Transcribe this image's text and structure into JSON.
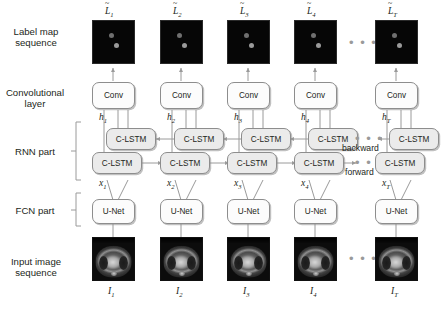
{
  "figure": {
    "row_labels": [
      {
        "id": "label-map-sequence",
        "text": "Label map\nsequence"
      },
      {
        "id": "convolutional-layer",
        "text": "Convolutional\nlayer"
      },
      {
        "id": "rnn-part",
        "text": "RNN part"
      },
      {
        "id": "fcn-part",
        "text": "FCN part"
      },
      {
        "id": "input-image-sequence",
        "text": "Input image\nsequence"
      }
    ],
    "direction_labels": {
      "backward": "backward",
      "forward": "forward"
    },
    "ellipsis": "• • •",
    "node_labels": {
      "conv": "Conv",
      "lstm": "C-LSTM",
      "unet": "U-Net"
    },
    "columns": [
      {
        "index": 1,
        "output_label": {
          "base": "L",
          "accent": "~",
          "sub": "1"
        },
        "hidden_label": {
          "base": "h",
          "sub": "1"
        },
        "feature_label": {
          "base": "x",
          "sub": "1"
        },
        "input_label": {
          "base": "I",
          "sub": "1"
        },
        "conv": "Conv",
        "lstm_backward": "C-LSTM",
        "lstm_forward": "C-LSTM",
        "unet": "U-Net"
      },
      {
        "index": 2,
        "output_label": {
          "base": "L",
          "accent": "~",
          "sub": "2"
        },
        "hidden_label": {
          "base": "h",
          "sub": "2"
        },
        "feature_label": {
          "base": "x",
          "sub": "2"
        },
        "input_label": {
          "base": "I",
          "sub": "2"
        },
        "conv": "Conv",
        "lstm_backward": "C-LSTM",
        "lstm_forward": "C-LSTM",
        "unet": "U-Net"
      },
      {
        "index": 3,
        "output_label": {
          "base": "L",
          "accent": "~",
          "sub": "3"
        },
        "hidden_label": {
          "base": "h",
          "sub": "3"
        },
        "feature_label": {
          "base": "x",
          "sub": "3"
        },
        "input_label": {
          "base": "I",
          "sub": "3"
        },
        "conv": "Conv",
        "lstm_backward": "C-LSTM",
        "lstm_forward": "C-LSTM",
        "unet": "U-Net"
      },
      {
        "index": 4,
        "output_label": {
          "base": "L",
          "accent": "~",
          "sub": "4"
        },
        "hidden_label": {
          "base": "h",
          "sub": "4"
        },
        "feature_label": {
          "base": "x",
          "sub": "4"
        },
        "input_label": {
          "base": "I",
          "sub": "4"
        },
        "conv": "Conv",
        "lstm_backward": "C-LSTM",
        "lstm_forward": "C-LSTM",
        "unet": "U-Net"
      },
      {
        "index": 5,
        "output_label": {
          "base": "L",
          "accent": "~",
          "sub": "T"
        },
        "hidden_label": {
          "base": "h",
          "sub": "T"
        },
        "feature_label": {
          "base": "x",
          "sub": "T"
        },
        "input_label": {
          "base": "I",
          "sub": "T"
        },
        "conv": "Conv",
        "lstm_backward": "C-LSTM",
        "lstm_forward": "C-LSTM",
        "unet": "U-Net"
      }
    ],
    "colors": {
      "background": "#ffffff",
      "text": "#231f20",
      "node_border": "#8d8d8d",
      "node_fill_light": "#fcfcfc",
      "node_fill_gray": "#ebebeb",
      "wire": "#9a9a9a",
      "label_map_background": "#060606",
      "label_map_blob_dark": "#6f6f6f",
      "label_map_blob_light": "#9a9a9a"
    }
  }
}
